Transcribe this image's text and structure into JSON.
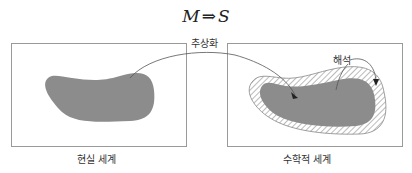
{
  "formula": {
    "left": "M",
    "operator": "⇒",
    "right": "S"
  },
  "labels": {
    "abstraction": "추상화",
    "interpretation": "해석",
    "real_world": "현실 세계",
    "math_world": "수학적 세계"
  },
  "colors": {
    "blob_fill": "#8c8c8c",
    "box_stroke": "#9a9a9a",
    "arrow_stroke": "#555555",
    "hatch": "#777777"
  }
}
